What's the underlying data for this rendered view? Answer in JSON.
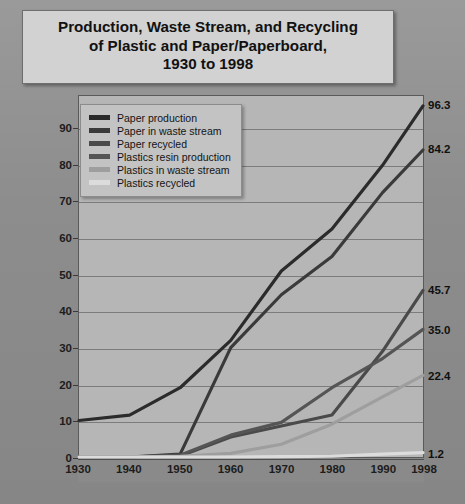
{
  "title": {
    "line1": "Production, Waste Stream, and Recycling",
    "line2": "of Plastic and Paper/Paperboard,",
    "line3": "1930 to 1998"
  },
  "chart_data": {
    "type": "line",
    "title": "Production, Waste Stream, and Recycling of Plastic and Paper/Paperboard, 1930 to 1998",
    "xlabel": "",
    "ylabel": "Millions of Tons",
    "x": [
      1930,
      1940,
      1950,
      1960,
      1970,
      1980,
      1990,
      1998
    ],
    "xticklabels": [
      "1930",
      "1940",
      "1950",
      "1960",
      "1970",
      "1980",
      "1990",
      "1998"
    ],
    "yticks": [
      0,
      10,
      20,
      30,
      40,
      50,
      60,
      70,
      80,
      90
    ],
    "yticklabels": [
      "0",
      "10",
      "20",
      "30",
      "40",
      "50",
      "60",
      "70",
      "80",
      "90"
    ],
    "ylim": [
      0,
      99
    ],
    "xlim": [
      1930,
      1998
    ],
    "grid": true,
    "legend_position": "upper-left",
    "series": [
      {
        "name": "Paper production",
        "color": "#2b2b2b",
        "end_label": "96.3",
        "values": [
          10.0,
          11.5,
          19.0,
          32.0,
          51.0,
          62.5,
          80.0,
          96.3
        ]
      },
      {
        "name": "Paper in waste stream",
        "color": "#3a3a3a",
        "end_label": "84.2",
        "values": [
          0.0,
          0.0,
          0.8,
          30.0,
          44.5,
          55.0,
          72.5,
          84.2
        ]
      },
      {
        "name": "Paper recycled",
        "color": "#4a4a4a",
        "end_label": "45.7",
        "values": [
          0.0,
          0.0,
          0.3,
          5.5,
          8.5,
          11.5,
          29.0,
          45.7
        ]
      },
      {
        "name": "Plastics resin production",
        "color": "#555555",
        "end_label": "35.0",
        "values": [
          0.0,
          0.0,
          0.5,
          6.0,
          9.5,
          19.0,
          27.0,
          35.0
        ]
      },
      {
        "name": "Plastics in waste stream",
        "color": "#9e9e9e",
        "end_label": "22.4",
        "values": [
          0.0,
          0.0,
          0.2,
          1.0,
          3.5,
          9.0,
          16.5,
          22.4
        ]
      },
      {
        "name": "Plastics recycled",
        "color": "#dcdcdc",
        "end_label": "1.2",
        "values": [
          0.0,
          0.0,
          0.0,
          0.0,
          0.1,
          0.2,
          0.8,
          1.2
        ]
      }
    ]
  }
}
